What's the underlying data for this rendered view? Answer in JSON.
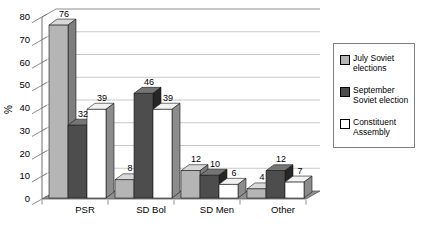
{
  "chart_data": {
    "type": "bar",
    "style": "3d-clustered-column",
    "title": "",
    "categories": [
      "PSR",
      "SD Bol",
      "SD Men",
      "Other"
    ],
    "series": [
      {
        "name": "July Soviet elections",
        "values": [
          76,
          8,
          12,
          4
        ],
        "color": "#b5b5b5",
        "top_color": "#d9d9d9",
        "side_color": "#7d7d7d"
      },
      {
        "name": "September Soviet election",
        "values": [
          32,
          46,
          10,
          12
        ],
        "color": "#4d4d4d",
        "top_color": "#757575",
        "side_color": "#262626"
      },
      {
        "name": "Constituent Assembly",
        "values": [
          39,
          39,
          6,
          7
        ],
        "color": "#ffffff",
        "top_color": "#f2f2f2",
        "side_color": "#8c8c8c"
      }
    ],
    "xlabel": "",
    "ylabel": "%",
    "ylim": [
      0,
      80
    ],
    "yticks": [
      0,
      10,
      20,
      30,
      40,
      50,
      60,
      70,
      80
    ],
    "grid": true,
    "value_labels": true,
    "legend_position": "right"
  },
  "legend": {
    "items": [
      {
        "label": "July Soviet\nelections",
        "color": "#b5b5b5"
      },
      {
        "label": "September\nSoviet election",
        "color": "#4d4d4d"
      },
      {
        "label": "Constituent\nAssembly",
        "color": "#ffffff"
      }
    ]
  },
  "colors": {
    "background": "#ffffff",
    "floor": "#8f8f8f",
    "gridline": "#c9c9c9",
    "axis": "#6e6e6e",
    "wall": "#ffffff",
    "bar_outline": "#1a1a1a",
    "legend_border": "#7f7f7f"
  }
}
